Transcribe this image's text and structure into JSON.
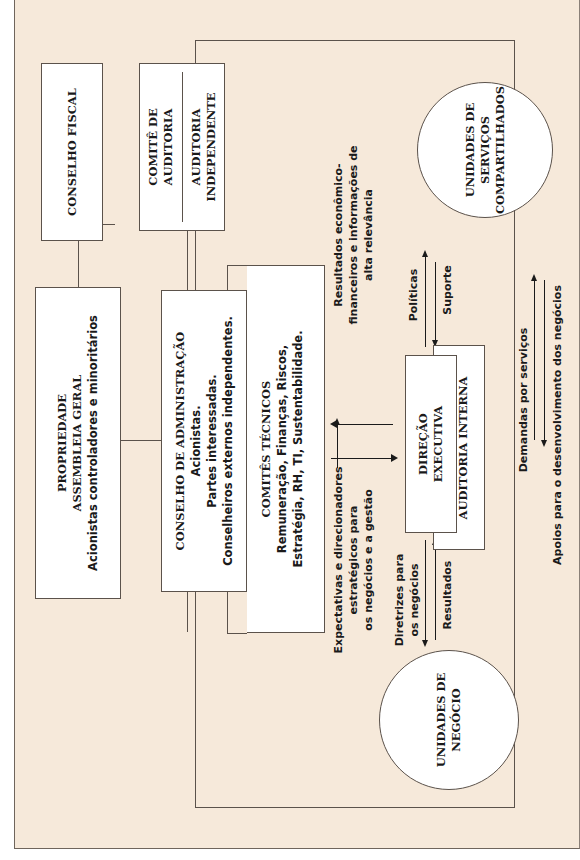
{
  "diagram": {
    "orientation": "rotated-90-ccw",
    "colors": {
      "background": "#f6e9da",
      "box_fill": "#ffffff",
      "border": "#5b524b",
      "text": "#1a1a1a"
    },
    "nodes": {
      "conselho_fiscal": {
        "title": "CONSELHO FISCAL"
      },
      "propriedade": {
        "title1": "PROPRIEDADE",
        "title2": "ASSEMBLEIA GERAL",
        "line3": "Acionistas controladores e minoritários"
      },
      "comite_auditoria": {
        "line1": "COMITÊ DE",
        "line2": "AUDITORIA"
      },
      "auditoria_independente": {
        "line1": "AUDITORIA",
        "line2": "INDEPENDENTE"
      },
      "conselho_administracao": {
        "title": "CONSELHO DE ADMINISTRAÇÃO",
        "line2": "Acionistas.",
        "line3": "Partes interessadas.",
        "line4": "Conselheiros externos independentes."
      },
      "comites_tecnicos": {
        "title": "COMITÊS TÉCNICOS",
        "line2": "Remuneração, Finanças, Riscos,",
        "line3": "Estratégia, RH, TI, Sustentabilidade."
      },
      "direcao_executiva": {
        "line1": "DIREÇÃO",
        "line2": "EXECUTIVA"
      },
      "auditoria_interna": {
        "title": "AUDITORIA INTERNA"
      },
      "unidades_servicos": {
        "line1": "UNIDADES DE",
        "line2": "SERVIÇOS",
        "line3": "COMPARTILHADOS"
      },
      "unidades_negocio": {
        "line1": "UNIDADES DE",
        "line2": "NEGÓCIO"
      }
    },
    "edges": {
      "resultados_economicos": {
        "line1": "Resultados econômico-",
        "line2": "financeiros e informações de",
        "line3": "alta relevância"
      },
      "expectativas": {
        "line1": "Expectativas e direcionadores",
        "line2": "estratégicos para",
        "line3": "os negócios e a gestão"
      },
      "politicas": "Políticas",
      "suporte": "Suporte",
      "diretrizes": {
        "line1": "Diretrizes para",
        "line2": "os negócios"
      },
      "resultados": "Resultados",
      "demandas": "Demandas por serviços",
      "apoios": "Apoios para o desenvolvimento dos negócios"
    }
  }
}
